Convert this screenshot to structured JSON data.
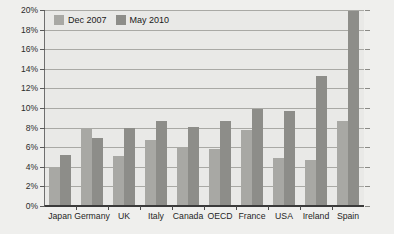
{
  "chart_data": {
    "type": "bar",
    "title": "",
    "xlabel": "",
    "ylabel": "",
    "ylim": [
      0,
      20
    ],
    "ytick_step": 2,
    "ytick_labels": [
      "0%",
      "2%",
      "4%",
      "6%",
      "8%",
      "10%",
      "12%",
      "14%",
      "16%",
      "18%",
      "20%"
    ],
    "grid": true,
    "legend_position": "top-left",
    "categories": [
      "Japan",
      "Germany",
      "UK",
      "Italy",
      "Canada",
      "OECD",
      "France",
      "USA",
      "Ireland",
      "Spain"
    ],
    "series": [
      {
        "name": "Dec 2007",
        "color": "#a8a8a4",
        "values": [
          3.8,
          7.9,
          5.0,
          6.6,
          5.9,
          5.7,
          7.7,
          4.8,
          4.6,
          8.6
        ]
      },
      {
        "name": "May 2010",
        "color": "#8d8d89",
        "values": [
          5.1,
          6.8,
          7.9,
          8.6,
          8.0,
          8.6,
          9.8,
          9.6,
          13.2,
          19.8
        ]
      }
    ]
  },
  "legend": {
    "entries": [
      {
        "label": "Dec 2007"
      },
      {
        "label": "May 2010"
      }
    ]
  },
  "colors": {
    "series_dec2007": "#a8a8a4",
    "series_may2010": "#8d8d89",
    "plot_background": "#e9e9e7",
    "canvas_background": "#efefed",
    "gridline": "#a9a9a5",
    "axis": "#3a3a3a"
  }
}
